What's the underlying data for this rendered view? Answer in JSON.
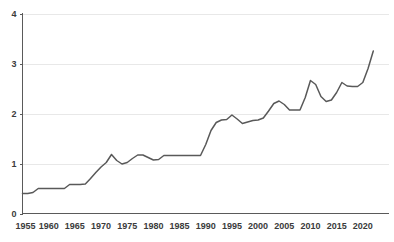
{
  "chart_data": {
    "type": "line",
    "title": "",
    "subtitle": "",
    "xlabel": "",
    "ylabel": "",
    "xlim": [
      1955,
      2025
    ],
    "ylim": [
      0,
      4
    ],
    "grid": true,
    "legend": null,
    "x_ticks": [
      1955,
      1960,
      1965,
      1970,
      1975,
      1980,
      1985,
      1990,
      1995,
      2000,
      2005,
      2010,
      2015,
      2020
    ],
    "y_ticks": [
      0,
      1,
      2,
      3,
      4
    ],
    "series": [
      {
        "name": "series-1",
        "color": "#595959",
        "x": [
          1955,
          1956,
          1957,
          1958,
          1959,
          1960,
          1961,
          1962,
          1963,
          1964,
          1965,
          1966,
          1967,
          1968,
          1969,
          1970,
          1971,
          1972,
          1973,
          1974,
          1975,
          1976,
          1977,
          1978,
          1979,
          1980,
          1981,
          1982,
          1983,
          1984,
          1985,
          1986,
          1987,
          1988,
          1989,
          1990,
          1991,
          1992,
          1993,
          1994,
          1995,
          1996,
          1997,
          1998,
          1999,
          2000,
          2001,
          2002,
          2003,
          2004,
          2005,
          2006,
          2007,
          2008,
          2009,
          2010,
          2011,
          2012,
          2013,
          2014,
          2015,
          2016,
          2017,
          2018,
          2019,
          2020,
          2021,
          2022
        ],
        "values": [
          0.4,
          0.4,
          0.42,
          0.5,
          0.5,
          0.5,
          0.5,
          0.5,
          0.5,
          0.58,
          0.58,
          0.58,
          0.59,
          0.7,
          0.82,
          0.93,
          1.02,
          1.18,
          1.06,
          0.99,
          1.02,
          1.1,
          1.17,
          1.17,
          1.12,
          1.07,
          1.08,
          1.16,
          1.16,
          1.16,
          1.16,
          1.16,
          1.16,
          1.16,
          1.16,
          1.38,
          1.66,
          1.82,
          1.87,
          1.88,
          1.97,
          1.89,
          1.8,
          1.83,
          1.86,
          1.87,
          1.91,
          2.05,
          2.2,
          2.25,
          2.18,
          2.07,
          2.07,
          2.07,
          2.32,
          2.66,
          2.58,
          2.34,
          2.24,
          2.27,
          2.42,
          2.62,
          2.55,
          2.54,
          2.54,
          2.62,
          2.9,
          3.25
        ]
      }
    ]
  },
  "axis": {
    "y_tick_labels": [
      "0",
      "1",
      "2",
      "3",
      "4"
    ],
    "x_tick_labels": [
      "1955",
      "1960",
      "1965",
      "1970",
      "1975",
      "1980",
      "1985",
      "1990",
      "1995",
      "2000",
      "2005",
      "2010",
      "2015",
      "2020"
    ]
  },
  "colors": {
    "line": "#595959",
    "grid": "#e8e8e8",
    "axis": "#5a5a5a",
    "text": "#3b3b3b",
    "background": "#ffffff"
  }
}
